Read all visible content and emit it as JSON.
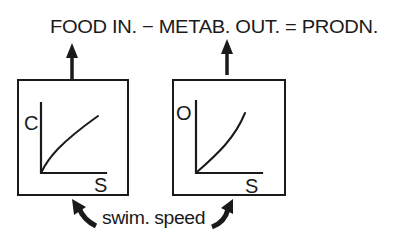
{
  "equation": {
    "text": "FOOD IN. − METAB. OUT. = PRODN.",
    "terms": [
      "FOOD IN.",
      "METAB. OUT.",
      "PRODN."
    ],
    "operators": [
      "−",
      "="
    ]
  },
  "graphs": [
    {
      "id": "consumption",
      "y_label": "C",
      "x_label": "S",
      "curve_shape": "concave-increasing",
      "arrow_target": "FOOD IN."
    },
    {
      "id": "oxygen",
      "y_label": "O",
      "x_label": "S",
      "curve_shape": "convex-increasing",
      "arrow_target": "METAB. OUT."
    }
  ],
  "caption": {
    "text": "swim. speed"
  },
  "colors": {
    "ink": "#1a1a1a",
    "background": "#ffffff"
  }
}
